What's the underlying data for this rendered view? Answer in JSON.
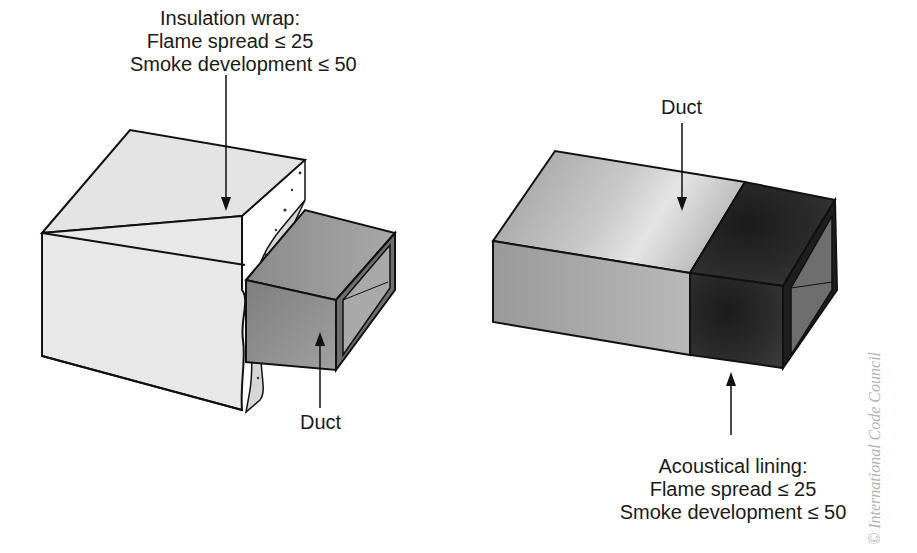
{
  "left_figure": {
    "wrap_label": {
      "title": "Insulation wrap:",
      "line1": "Flame spread ≤ 25",
      "line2": "Smoke development ≤ 50"
    },
    "duct_label": "Duct"
  },
  "right_figure": {
    "duct_label": "Duct",
    "lining_label": {
      "title": "Acoustical lining:",
      "line1": "Flame spread ≤ 25",
      "line2": "Smoke development ≤ 50"
    }
  },
  "watermark": "© International Code Council",
  "colors": {
    "wrap_fill": "#e6e6e6",
    "duct_gray": "#8f8f8f",
    "lining_dark": "#2a2a2a",
    "outline": "#111111"
  }
}
